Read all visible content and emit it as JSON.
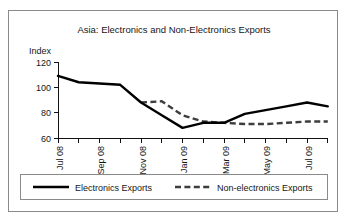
{
  "chart_data": {
    "type": "line",
    "title": "Asia: Electronics and Non-Electronics Exports",
    "xlabel": "",
    "ylabel": "Index",
    "ylim": [
      60,
      120
    ],
    "yticks": [
      60,
      80,
      100,
      120
    ],
    "ytick_labels": [
      "60",
      "80",
      "100",
      "120"
    ],
    "grid": false,
    "legend_position": "bottom",
    "x": [
      "Jul 08",
      "Aug 08",
      "Sep 08",
      "Oct 08",
      "Nov 08",
      "Dec 08",
      "Jan 09",
      "Feb 09",
      "Mar 09",
      "Apr 09",
      "May 09",
      "Jun 09",
      "Jul 09",
      "Aug 09"
    ],
    "xtick_labels": [
      "Jul 08",
      "Sep 08",
      "Nov 08",
      "Jan 09",
      "Mar 09",
      "May 09",
      "Jul 09"
    ],
    "xtick_indices": [
      0,
      2,
      4,
      6,
      8,
      10,
      12
    ],
    "series": [
      {
        "name": "Electronics Exports",
        "style": "solid",
        "color": "#000000",
        "values": [
          109,
          104,
          103,
          102,
          88,
          78,
          68,
          72,
          72,
          79,
          82,
          85,
          88,
          85
        ]
      },
      {
        "name": "Non-electronics Exports",
        "style": "dashed",
        "color": "#3d3d3d",
        "values": [
          null,
          null,
          null,
          null,
          88,
          89,
          78,
          73,
          72,
          71,
          71,
          72,
          73,
          73
        ],
        "start_index": 4
      }
    ],
    "legend": [
      {
        "label": "Electronics Exports",
        "style": "solid"
      },
      {
        "label": "Non-electronics Exports",
        "style": "dashed"
      }
    ]
  }
}
